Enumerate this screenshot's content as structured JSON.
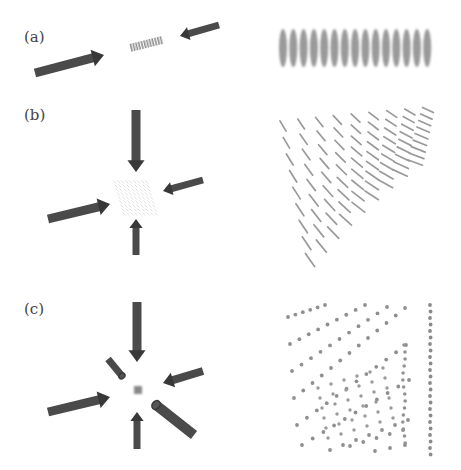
{
  "figure": {
    "width": 461,
    "height": 470,
    "colors": {
      "arrow": "#4a4a4a",
      "arrow_head": "#383838",
      "lattice": "#8c8c8c",
      "background": "#ffffff"
    },
    "panels": [
      {
        "id": "a",
        "label": "(a)",
        "label_pos": [
          24,
          42
        ],
        "description": "Two counter-propagating beams forming a 1D lattice of pancake-shaped sites",
        "arrows": [
          {
            "x1": 35,
            "y1": 73,
            "x2": 104,
            "y2": 55,
            "w": 9
          },
          {
            "x1": 219,
            "y1": 25,
            "x2": 180,
            "y2": 36,
            "w": 7
          }
        ],
        "center_object": {
          "type": "1d-stack",
          "x": 146,
          "y": 44,
          "count": 12
        },
        "result": {
          "type": "ellipse-row",
          "x0": 283,
          "y": 48,
          "count": 15,
          "dx": 10.3,
          "rx": 4,
          "ry": 19
        }
      },
      {
        "id": "b",
        "label": "(b)",
        "label_pos": [
          24,
          120
        ],
        "description": "Three beams forming a 2D lattice of tube-shaped sites",
        "arrows": [
          {
            "x1": 136,
            "y1": 110,
            "x2": 136,
            "y2": 172,
            "w": 9
          },
          {
            "x1": 203,
            "y1": 180,
            "x2": 163,
            "y2": 191,
            "w": 7
          },
          {
            "x1": 48,
            "y1": 219,
            "x2": 110,
            "y2": 204,
            "w": 9
          },
          {
            "x1": 136,
            "y1": 255,
            "x2": 136,
            "y2": 219,
            "w": 7
          }
        ],
        "center_object": {
          "type": "2d-grid",
          "x": 136,
          "y": 198,
          "size": 38
        },
        "result": {
          "type": "rod-array",
          "rows": 9,
          "cols": 9
        }
      },
      {
        "id": "c",
        "label": "(c)",
        "label_pos": [
          24,
          313
        ],
        "description": "Six beams forming a 3D lattice of point-like sites",
        "arrows": [
          {
            "x1": 137,
            "y1": 302,
            "x2": 137,
            "y2": 362,
            "w": 9
          },
          {
            "x1": 108,
            "y1": 359,
            "x2": 122,
            "y2": 376,
            "w": 7,
            "cylinder": true
          },
          {
            "x1": 203,
            "y1": 371,
            "x2": 163,
            "y2": 383,
            "w": 8
          },
          {
            "x1": 48,
            "y1": 412,
            "x2": 110,
            "y2": 397,
            "w": 9
          },
          {
            "x1": 137,
            "y1": 449,
            "x2": 137,
            "y2": 412,
            "w": 7
          },
          {
            "x1": 194,
            "y1": 435,
            "x2": 156,
            "y2": 405,
            "w": 10,
            "cylinder": true
          }
        ],
        "center_object": {
          "type": "point-cluster",
          "x": 138,
          "y": 390,
          "size": 8
        },
        "result": {
          "type": "dot-array-perspective",
          "vanish_x": 430,
          "vanish_y": 300
        }
      }
    ]
  }
}
